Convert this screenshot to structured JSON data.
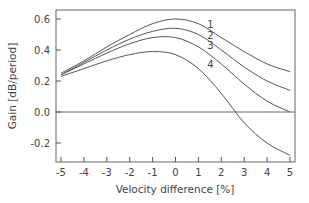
{
  "chart_data": {
    "type": "line",
    "title": "",
    "xlabel": "Velocity difference [%]",
    "ylabel": "Gain [dB/period]",
    "xlim": [
      -5,
      5
    ],
    "ylim": [
      -0.3,
      0.65
    ],
    "x_ticks": [
      -5,
      -4,
      -3,
      -2,
      -1,
      0,
      1,
      2,
      3,
      4,
      5
    ],
    "x_tick_labels": [
      "-5",
      "-4",
      "-3",
      "-2",
      "-1",
      "0",
      "1",
      "2",
      "3",
      "4",
      "5"
    ],
    "y_ticks": [
      0.6,
      0.4,
      0.2,
      0.0,
      -0.2
    ],
    "y_tick_labels": [
      "0.6",
      "0.4",
      "0.2",
      "0.0",
      "-0.2"
    ],
    "grid": false,
    "zero_line": true,
    "legend": "inline labels",
    "x": [
      -5,
      -4,
      -3,
      -2,
      -1,
      0,
      1,
      2,
      3,
      4,
      5
    ],
    "series": [
      {
        "name": "1",
        "values": [
          0.25,
          0.33,
          0.42,
          0.5,
          0.57,
          0.6,
          0.57,
          0.48,
          0.39,
          0.31,
          0.26
        ]
      },
      {
        "name": "2",
        "values": [
          0.24,
          0.32,
          0.4,
          0.47,
          0.52,
          0.54,
          0.5,
          0.4,
          0.29,
          0.2,
          0.14
        ]
      },
      {
        "name": "3",
        "values": [
          0.24,
          0.31,
          0.38,
          0.44,
          0.48,
          0.48,
          0.42,
          0.31,
          0.18,
          0.07,
          0.0
        ]
      },
      {
        "name": "4",
        "values": [
          0.23,
          0.28,
          0.33,
          0.37,
          0.39,
          0.37,
          0.28,
          0.12,
          -0.07,
          -0.2,
          -0.28
        ]
      }
    ],
    "curve_label_positions": [
      {
        "name": "1",
        "x": 1.25,
        "y": 0.57
      },
      {
        "name": "2",
        "x": 1.25,
        "y": 0.5
      },
      {
        "name": "3",
        "x": 1.25,
        "y": 0.43
      },
      {
        "name": "4",
        "x": 1.25,
        "y": 0.31
      }
    ]
  }
}
